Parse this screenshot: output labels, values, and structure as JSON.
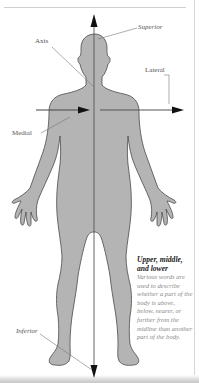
{
  "diagram": {
    "figure": "human-body-silhouette-front-view",
    "colors": {
      "body_fill": "#b4b4b4",
      "body_outline": "#4a4a4a",
      "axis_line": "#555555",
      "arrow_head": "#111111",
      "leader_line": "#777777",
      "label_text": "#555555",
      "caption_title": "#222222",
      "caption_body": "#8a8a8a"
    },
    "labels": {
      "superior": "Superior",
      "axis": "Axis",
      "lateral": "Lateral",
      "medial": "Medial",
      "inferior": "Inferior"
    },
    "caption": {
      "title": "Upper, middle, and lower",
      "body": "Various words are used to describe whether a part of the body is above, below, nearer, or further from the midline than another part of the body."
    },
    "arrows": [
      {
        "name": "superior-arrow",
        "direction": "up"
      },
      {
        "name": "inferior-arrow",
        "direction": "down"
      },
      {
        "name": "medial-arrow",
        "direction": "right-toward-midline"
      },
      {
        "name": "lateral-arrow",
        "direction": "right-away-from-midline"
      }
    ]
  }
}
